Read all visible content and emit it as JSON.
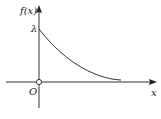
{
  "diagram": {
    "type": "function-graph",
    "y_axis_label": "f(x)",
    "x_axis_label": "x",
    "origin_label": "O",
    "y_intercept_label": "λ",
    "curve": "exponential decay from (0, λ) approaching x-axis",
    "colors": {
      "axis": "#333333",
      "curve": "#333333",
      "background": "#ffffff"
    }
  }
}
